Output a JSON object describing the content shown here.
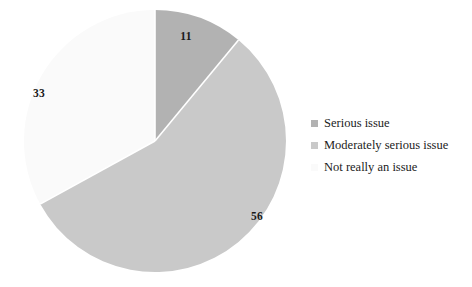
{
  "chart_data": {
    "type": "pie",
    "title": "",
    "subtitle": "",
    "xlabel": "",
    "ylabel": "",
    "categories": [
      "Serious issue",
      "Moderately serious issue",
      "Not really an issue"
    ],
    "values": [
      11,
      56,
      33
    ],
    "data_labels": [
      "11",
      "56",
      "33"
    ],
    "colors": [
      "#b2b2b2",
      "#c9c9c9",
      "#fafafa"
    ],
    "slice_border_color": "#ffffff",
    "start_angle_deg": 0,
    "direction": "clockwise",
    "legend": {
      "position": "right",
      "entries": [
        {
          "label": "Serious issue",
          "color": "#b2b2b2",
          "value": 11
        },
        {
          "label": "Moderately serious issue",
          "color": "#c9c9c9",
          "value": 56
        },
        {
          "label": "Not really an issue",
          "color": "#fafafa",
          "value": 33
        }
      ]
    },
    "grid": false,
    "total": 100
  },
  "geometry": {
    "center_x": 155,
    "center_y": 141,
    "radius": 131,
    "label_positions": [
      {
        "x": 186,
        "y": 36
      },
      {
        "x": 257,
        "y": 216
      },
      {
        "x": 39,
        "y": 93
      }
    ]
  },
  "background": "#ffffff"
}
